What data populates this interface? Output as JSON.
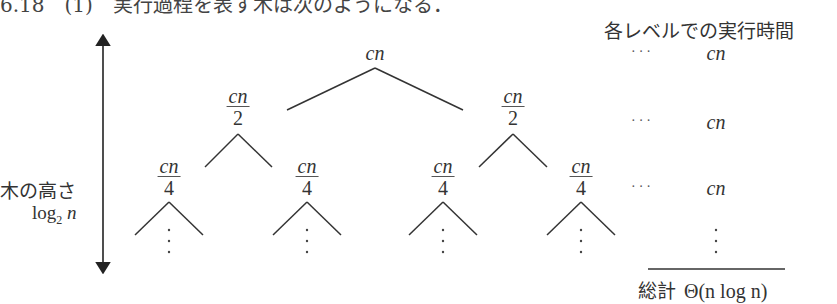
{
  "heading": "6.18　(1)　実行過程を表す木は次のようになる．",
  "left_label": {
    "title": "木の高さ",
    "height": "log",
    "height_sub": "2",
    "height_var": "n"
  },
  "right_column": {
    "title": "各レベルでの実行時間",
    "rows": [
      {
        "dots": "···",
        "value": "cn"
      },
      {
        "dots": "···",
        "value": "cn"
      },
      {
        "dots": "···",
        "value": "cn"
      }
    ],
    "total_label": "総計",
    "total_value": "Θ(n log n)"
  },
  "tree": {
    "root": "cn",
    "level1": [
      {
        "num": "cn",
        "den": "2"
      },
      {
        "num": "cn",
        "den": "2"
      }
    ],
    "level2": [
      {
        "num": "cn",
        "den": "4"
      },
      {
        "num": "cn",
        "den": "4"
      },
      {
        "num": "cn",
        "den": "4"
      },
      {
        "num": "cn",
        "den": "4"
      }
    ]
  },
  "colors": {
    "ink": "#333333",
    "background": "#ffffff"
  }
}
